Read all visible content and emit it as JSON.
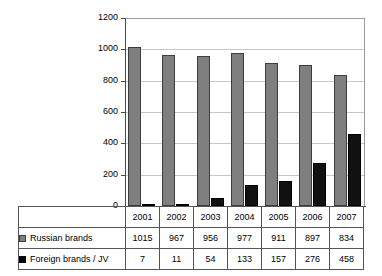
{
  "chart_data": {
    "type": "bar",
    "title": "",
    "subtitle": "",
    "xlabel": "",
    "ylabel": "",
    "categories": [
      "2001",
      "2002",
      "2003",
      "2004",
      "2005",
      "2006",
      "2007"
    ],
    "series": [
      {
        "name": "Russian brands",
        "values": [
          1015,
          967,
          956,
          977,
          911,
          897,
          834
        ],
        "color": "#7f7f7f"
      },
      {
        "name": "Foreign brands / JV",
        "values": [
          7,
          11,
          54,
          133,
          157,
          276,
          458
        ],
        "color": "#000000"
      }
    ],
    "ylim": [
      0,
      1200
    ],
    "y_ticks": [
      "1200",
      "1000",
      "800",
      "600",
      "400",
      "200",
      "0"
    ],
    "grid": true,
    "legend_position": "table-below",
    "annotations": []
  },
  "table": {
    "header_row": [
      "2001",
      "2002",
      "2003",
      "2004",
      "2005",
      "2006",
      "2007"
    ],
    "rows": [
      {
        "label": "Russian brands",
        "swatch": "gray-square-icon",
        "values": [
          "1015",
          "967",
          "956",
          "977",
          "911",
          "897",
          "834"
        ]
      },
      {
        "label": "Foreign brands / JV",
        "swatch": "black-square-icon",
        "values": [
          "7",
          "11",
          "54",
          "133",
          "157",
          "276",
          "458"
        ]
      }
    ]
  },
  "axis": {
    "y_ticks": [
      "1200",
      "1000",
      "800",
      "600",
      "400",
      "200",
      "0"
    ]
  },
  "colors": {
    "russian": "#7f7f7f",
    "foreign": "#000000",
    "grid": "#c8c8c8",
    "axis": "#4a4a4a",
    "background": "#ffffff"
  }
}
